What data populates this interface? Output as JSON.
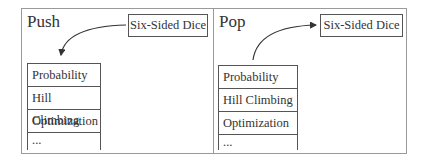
{
  "panels": [
    {
      "title": "Push",
      "item_box": "Six-Sided Dice",
      "arrow_direction": "box-to-stack",
      "stack": [
        "Probability",
        "Hill Climbing",
        "Optimization",
        "..."
      ]
    },
    {
      "title": "Pop",
      "item_box": "Six-Sided Dice",
      "arrow_direction": "stack-to-box",
      "stack": [
        "Probability",
        "Hill Climbing",
        "Optimization",
        "..."
      ]
    }
  ],
  "colors": {
    "border": "#555555",
    "frame": "#9a9a9a",
    "text": "#333333"
  }
}
